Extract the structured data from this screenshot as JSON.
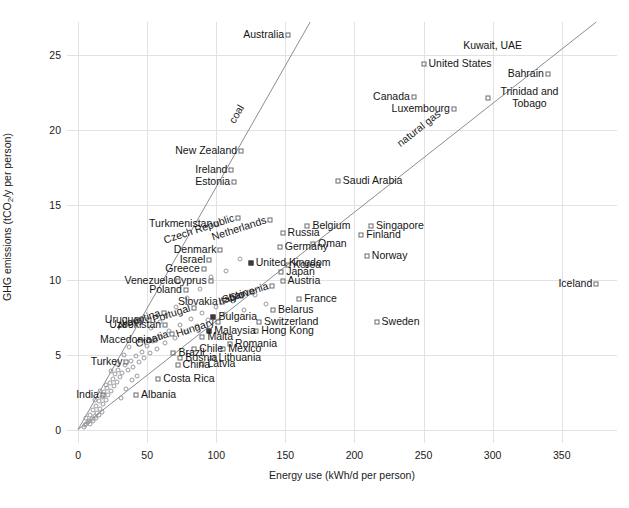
{
  "chart_data": {
    "type": "scatter",
    "title": "",
    "xlabel": "Energy use (kWh/d per person)",
    "ylabel_parts": {
      "pre": "GHG emissions (tCO",
      "sub": "2",
      "post": "/y per person)"
    },
    "ylabel": "GHG emissions (tCO2/y per person)",
    "xlim": [
      -8,
      390
    ],
    "ylim": [
      -0.9,
      27.2
    ],
    "xticks": [
      0,
      50,
      100,
      150,
      200,
      250,
      300,
      350
    ],
    "yticks": [
      0,
      5,
      10,
      15,
      20,
      25
    ],
    "grid": true,
    "legend": "none",
    "trend_lines": [
      {
        "name": "coal",
        "label": "coal",
        "x1": 0,
        "y1": 0,
        "x2": 168,
        "y2": 27.2,
        "label_x": 118,
        "label_y": 19.8
      },
      {
        "name": "natural-gas",
        "label": "natural gas",
        "x1": 0,
        "y1": 0,
        "x2": 375,
        "y2": 27.2,
        "label_x": 250,
        "label_y": 18.3
      }
    ],
    "points": [
      {
        "name": "Australia",
        "x": 152,
        "y": 26.3,
        "marker": "square",
        "label_pos": "left"
      },
      {
        "name": "Kuwait, UAE",
        "x": 300,
        "y": 25.6,
        "marker": "none",
        "label_pos": "mid"
      },
      {
        "name": "United States",
        "x": 250,
        "y": 24.4,
        "marker": "square",
        "label_pos": "right"
      },
      {
        "name": "Bahrain",
        "x": 340,
        "y": 23.7,
        "marker": "square",
        "label_pos": "left"
      },
      {
        "name": "Canada",
        "x": 243,
        "y": 22.2,
        "marker": "square",
        "label_pos": "left"
      },
      {
        "name": "Trinidad and Tobago",
        "x": 297,
        "y": 22.1,
        "marker": "square",
        "label_pos": "right"
      },
      {
        "name": "Luxembourg",
        "x": 272,
        "y": 21.4,
        "marker": "square",
        "label_pos": "left"
      },
      {
        "name": "New Zealand",
        "x": 118,
        "y": 18.6,
        "marker": "square",
        "label_pos": "left"
      },
      {
        "name": "Ireland",
        "x": 111,
        "y": 17.3,
        "marker": "square",
        "label_pos": "left"
      },
      {
        "name": "Estonia",
        "x": 113,
        "y": 16.5,
        "marker": "square",
        "label_pos": "left"
      },
      {
        "name": "Saudi Arabia",
        "x": 188,
        "y": 16.6,
        "marker": "square",
        "label_pos": "right"
      },
      {
        "name": "Netherlands",
        "x": 139,
        "y": 14.0,
        "marker": "square",
        "label_pos": "rot"
      },
      {
        "name": "Czech Republic",
        "x": 116,
        "y": 14.1,
        "marker": "square",
        "label_pos": "rot"
      },
      {
        "name": "Turkmenistan",
        "x": 100,
        "y": 13.7,
        "marker": "square",
        "label_pos": "left"
      },
      {
        "name": "Belgium",
        "x": 166,
        "y": 13.6,
        "marker": "square",
        "label_pos": "right"
      },
      {
        "name": "Singapore",
        "x": 212,
        "y": 13.6,
        "marker": "square",
        "label_pos": "right"
      },
      {
        "name": "Russia",
        "x": 148,
        "y": 13.1,
        "marker": "square",
        "label_pos": "right"
      },
      {
        "name": "Finland",
        "x": 205,
        "y": 13.0,
        "marker": "square",
        "label_pos": "right"
      },
      {
        "name": "Denmark",
        "x": 103,
        "y": 12.0,
        "marker": "square",
        "label_pos": "left"
      },
      {
        "name": "Germany",
        "x": 146,
        "y": 12.2,
        "marker": "square",
        "label_pos": "right"
      },
      {
        "name": "Oman",
        "x": 170,
        "y": 12.4,
        "marker": "square",
        "label_pos": "right"
      },
      {
        "name": "Israel",
        "x": 95,
        "y": 11.3,
        "marker": "square",
        "label_pos": "left"
      },
      {
        "name": "United Kingdom",
        "x": 125,
        "y": 11.1,
        "marker": "filled",
        "label_pos": "right"
      },
      {
        "name": "Korea",
        "x": 152,
        "y": 11.0,
        "marker": "square",
        "label_pos": "right"
      },
      {
        "name": "Norway",
        "x": 209,
        "y": 11.6,
        "marker": "square",
        "label_pos": "right"
      },
      {
        "name": "Greece",
        "x": 91,
        "y": 10.7,
        "marker": "square",
        "label_pos": "left"
      },
      {
        "name": "Japan",
        "x": 147,
        "y": 10.5,
        "marker": "square",
        "label_pos": "right"
      },
      {
        "name": "Iceland",
        "x": 375,
        "y": 9.7,
        "marker": "square",
        "label_pos": "left"
      },
      {
        "name": "Venezuela",
        "x": 72,
        "y": 9.9,
        "marker": "square",
        "label_pos": "left"
      },
      {
        "name": "Cyprus",
        "x": 96,
        "y": 9.9,
        "marker": "square",
        "label_pos": "left"
      },
      {
        "name": "Austria",
        "x": 148,
        "y": 9.9,
        "marker": "square",
        "label_pos": "right"
      },
      {
        "name": "Slovenia",
        "x": 140,
        "y": 9.6,
        "marker": "square",
        "label_pos": "rot"
      },
      {
        "name": "Poland",
        "x": 78,
        "y": 9.3,
        "marker": "square",
        "label_pos": "left"
      },
      {
        "name": "Spain",
        "x": 126,
        "y": 9.2,
        "marker": "square",
        "label_pos": "rot"
      },
      {
        "name": "Italy",
        "x": 118,
        "y": 8.9,
        "marker": "square",
        "label_pos": "rot"
      },
      {
        "name": "France",
        "x": 160,
        "y": 8.7,
        "marker": "square",
        "label_pos": "right"
      },
      {
        "name": "Slovakia",
        "x": 104,
        "y": 8.5,
        "marker": "square",
        "label_pos": "left"
      },
      {
        "name": "Portugal",
        "x": 84,
        "y": 8.1,
        "marker": "square",
        "label_pos": "rot"
      },
      {
        "name": "Belarus",
        "x": 141,
        "y": 8.0,
        "marker": "square",
        "label_pos": "right"
      },
      {
        "name": "Argentina",
        "x": 62,
        "y": 7.8,
        "marker": "square",
        "label_pos": "rot"
      },
      {
        "name": "Bulgaria",
        "x": 98,
        "y": 7.5,
        "marker": "filled",
        "label_pos": "right"
      },
      {
        "name": "Hungary",
        "x": 101,
        "y": 7.2,
        "marker": "square",
        "label_pos": "rot"
      },
      {
        "name": "Switzerland",
        "x": 131,
        "y": 7.2,
        "marker": "square",
        "label_pos": "right"
      },
      {
        "name": "Sweden",
        "x": 216,
        "y": 7.2,
        "marker": "square",
        "label_pos": "right"
      },
      {
        "name": "Uruguay",
        "x": 51,
        "y": 7.3,
        "marker": "square",
        "label_pos": "left"
      },
      {
        "name": "Uzbekistan",
        "x": 63,
        "y": 7.0,
        "marker": "square",
        "label_pos": "left"
      },
      {
        "name": "Malaysia",
        "x": 95,
        "y": 6.6,
        "marker": "filled",
        "label_pos": "right"
      },
      {
        "name": "Hong Kong",
        "x": 129,
        "y": 6.6,
        "marker": "square",
        "label_pos": "right"
      },
      {
        "name": "Croatia",
        "x": 68,
        "y": 6.4,
        "marker": "square",
        "label_pos": "rot"
      },
      {
        "name": "Malta",
        "x": 90,
        "y": 6.2,
        "marker": "square",
        "label_pos": "right"
      },
      {
        "name": "Macedonia",
        "x": 56,
        "y": 6.0,
        "marker": "square",
        "label_pos": "left"
      },
      {
        "name": "Romania",
        "x": 110,
        "y": 5.7,
        "marker": "square",
        "label_pos": "right"
      },
      {
        "name": "Chile",
        "x": 84,
        "y": 5.4,
        "marker": "square",
        "label_pos": "right"
      },
      {
        "name": "Mexico",
        "x": 105,
        "y": 5.4,
        "marker": "square",
        "label_pos": "right"
      },
      {
        "name": "Brazil",
        "x": 69,
        "y": 5.1,
        "marker": "square",
        "label_pos": "right"
      },
      {
        "name": "Bosnia",
        "x": 74,
        "y": 4.8,
        "marker": "square",
        "label_pos": "right"
      },
      {
        "name": "Lithuania",
        "x": 98,
        "y": 4.8,
        "marker": "square",
        "label_pos": "right"
      },
      {
        "name": "China",
        "x": 72,
        "y": 4.3,
        "marker": "square",
        "label_pos": "right"
      },
      {
        "name": "Latvia",
        "x": 90,
        "y": 4.4,
        "marker": "square",
        "label_pos": "right"
      },
      {
        "name": "Turkey",
        "x": 35,
        "y": 4.5,
        "marker": "square",
        "label_pos": "left"
      },
      {
        "name": "Costa Rica",
        "x": 58,
        "y": 3.4,
        "marker": "square",
        "label_pos": "right"
      },
      {
        "name": "India",
        "x": 18,
        "y": 2.3,
        "marker": "square",
        "label_pos": "left"
      },
      {
        "name": "Albania",
        "x": 42,
        "y": 2.3,
        "marker": "square",
        "label_pos": "right"
      }
    ],
    "unlabeled_points": [
      {
        "x": 6,
        "y": 0.4
      },
      {
        "x": 8,
        "y": 0.6
      },
      {
        "x": 10,
        "y": 0.7
      },
      {
        "x": 9,
        "y": 1.0
      },
      {
        "x": 12,
        "y": 0.9
      },
      {
        "x": 11,
        "y": 1.3
      },
      {
        "x": 14,
        "y": 1.1
      },
      {
        "x": 13,
        "y": 1.6
      },
      {
        "x": 16,
        "y": 1.4
      },
      {
        "x": 15,
        "y": 1.9
      },
      {
        "x": 18,
        "y": 1.7
      },
      {
        "x": 17,
        "y": 2.2
      },
      {
        "x": 20,
        "y": 2.0
      },
      {
        "x": 19,
        "y": 2.5
      },
      {
        "x": 22,
        "y": 2.3
      },
      {
        "x": 21,
        "y": 2.8
      },
      {
        "x": 24,
        "y": 2.6
      },
      {
        "x": 23,
        "y": 3.1
      },
      {
        "x": 26,
        "y": 2.9
      },
      {
        "x": 25,
        "y": 3.4
      },
      {
        "x": 28,
        "y": 3.2
      },
      {
        "x": 27,
        "y": 3.7
      },
      {
        "x": 30,
        "y": 3.5
      },
      {
        "x": 29,
        "y": 4.0
      },
      {
        "x": 32,
        "y": 3.8
      },
      {
        "x": 34,
        "y": 4.3
      },
      {
        "x": 36,
        "y": 4.0
      },
      {
        "x": 38,
        "y": 4.6
      },
      {
        "x": 40,
        "y": 4.2
      },
      {
        "x": 42,
        "y": 4.9
      },
      {
        "x": 44,
        "y": 4.5
      },
      {
        "x": 46,
        "y": 5.2
      },
      {
        "x": 48,
        "y": 4.8
      },
      {
        "x": 50,
        "y": 5.6
      },
      {
        "x": 52,
        "y": 5.1
      },
      {
        "x": 54,
        "y": 5.9
      },
      {
        "x": 57,
        "y": 5.4
      },
      {
        "x": 60,
        "y": 6.2
      },
      {
        "x": 63,
        "y": 5.8
      },
      {
        "x": 66,
        "y": 6.6
      },
      {
        "x": 70,
        "y": 6.1
      },
      {
        "x": 74,
        "y": 7.0
      },
      {
        "x": 78,
        "y": 6.5
      },
      {
        "x": 82,
        "y": 7.4
      },
      {
        "x": 86,
        "y": 6.9
      },
      {
        "x": 90,
        "y": 7.8
      },
      {
        "x": 94,
        "y": 7.3
      },
      {
        "x": 100,
        "y": 8.2
      },
      {
        "x": 106,
        "y": 7.7
      },
      {
        "x": 112,
        "y": 8.6
      },
      {
        "x": 120,
        "y": 8.0
      },
      {
        "x": 128,
        "y": 9.0
      },
      {
        "x": 136,
        "y": 8.4
      },
      {
        "x": 5,
        "y": 0.3
      },
      {
        "x": 7,
        "y": 0.5
      },
      {
        "x": 4,
        "y": 0.2
      },
      {
        "x": 6,
        "y": 0.8
      },
      {
        "x": 9,
        "y": 0.4
      },
      {
        "x": 11,
        "y": 0.6
      },
      {
        "x": 13,
        "y": 0.8
      },
      {
        "x": 15,
        "y": 1.0
      },
      {
        "x": 17,
        "y": 1.2
      },
      {
        "x": 12,
        "y": 2.0
      },
      {
        "x": 16,
        "y": 2.6
      },
      {
        "x": 20,
        "y": 3.0
      },
      {
        "x": 24,
        "y": 3.9
      },
      {
        "x": 28,
        "y": 4.4
      },
      {
        "x": 33,
        "y": 5.0
      },
      {
        "x": 37,
        "y": 5.5
      },
      {
        "x": 45,
        "y": 6.0
      },
      {
        "x": 53,
        "y": 6.8
      },
      {
        "x": 59,
        "y": 7.2
      },
      {
        "x": 64,
        "y": 7.6
      },
      {
        "x": 71,
        "y": 8.2
      },
      {
        "x": 79,
        "y": 8.8
      },
      {
        "x": 88,
        "y": 9.4
      },
      {
        "x": 96,
        "y": 10.2
      },
      {
        "x": 107,
        "y": 10.6
      },
      {
        "x": 117,
        "y": 11.4
      },
      {
        "x": 31,
        "y": 2.1
      },
      {
        "x": 35,
        "y": 2.7
      },
      {
        "x": 39,
        "y": 3.3
      },
      {
        "x": 43,
        "y": 3.6
      }
    ]
  }
}
